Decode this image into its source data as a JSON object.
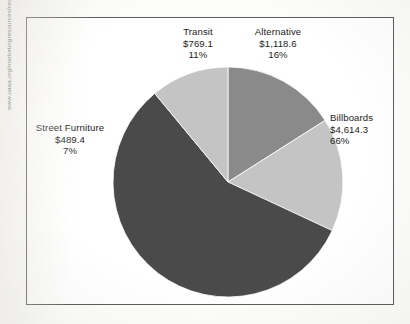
{
  "source_url": "www.oaaa.org/marketingresources/revenue/outdoorpiechart.aspx",
  "chart_data": {
    "type": "pie",
    "title": "",
    "subtitle": "",
    "xlabel": "",
    "ylabel": "",
    "legend_position": "none",
    "grid": false,
    "value_prefix": "$",
    "categories": [
      "Alternative",
      "Billboards",
      "Street Furniture",
      "Transit"
    ],
    "values": [
      1118.6,
      4614.3,
      489.4,
      769.1
    ],
    "percentages": [
      16,
      66,
      7,
      11
    ],
    "slices": [
      {
        "name": "Alternative",
        "value": 1118.6,
        "value_label": "$1,118.6",
        "percent": 16,
        "percent_label": "16%",
        "color": "#8a8a8a",
        "start_angle": 0,
        "end_angle": 57.6
      },
      {
        "name": "Billboards",
        "value": 4614.3,
        "value_label": "$4,614.3",
        "percent": 66,
        "percent_label": "66%",
        "color": "#c4c4c4",
        "start_angle": 57.6,
        "end_angle": 115.0
      },
      {
        "name": "Street Furniture",
        "value": 489.4,
        "value_label": "$489.4",
        "percent": 7,
        "percent_label": "7%",
        "color": "#4a4a4a",
        "start_angle": 115.0,
        "end_angle": 320.4
      },
      {
        "name": "Transit",
        "value": 769.1,
        "value_label": "$769.1",
        "percent": 11,
        "percent_label": "11%",
        "color": "#c4c4c4",
        "start_angle": 320.4,
        "end_angle": 360
      }
    ],
    "labels": {
      "transit": {
        "name": "Transit",
        "value_label": "$769.1",
        "percent_label": "11%"
      },
      "alternative": {
        "name": "Alternative",
        "value_label": "$1,118.6",
        "percent_label": "16%"
      },
      "billboards": {
        "name": "Billboards",
        "value_label": "$4,614.3",
        "percent_label": "66%"
      },
      "street_furniture": {
        "name": "Street Furniture",
        "value_label": "$489.4",
        "percent_label": "7%"
      }
    },
    "colors": {
      "dark_grey": "#4a4a4a",
      "medium_grey": "#8a8a8a",
      "light_grey": "#c4c4c4",
      "frame": "#5c5c5c",
      "text": "#1d1d1d"
    }
  }
}
